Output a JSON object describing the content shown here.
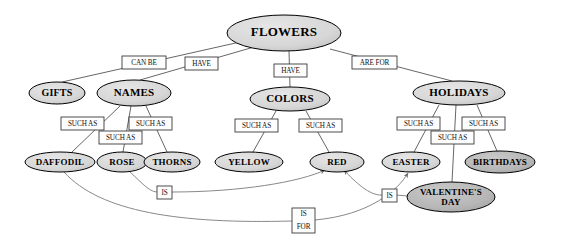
{
  "diagram": {
    "type": "concept-map",
    "colors": {
      "node_fill_light": "#d9d9d9",
      "node_fill_dark": "#b5b5b5",
      "node_stroke": "#000000",
      "edge_stroke": "#555555",
      "curve_stroke": "#7a7a7a",
      "label_box_fill": "#fdfdfd",
      "label_box_stroke": "#3a3a3a",
      "background": "#ffffff"
    },
    "nodes": [
      {
        "id": "flowers",
        "label": "FLOWERS",
        "cx": 284,
        "cy": 33,
        "rx": 57,
        "ry": 18,
        "font": 13,
        "fill": "#d9d9d9",
        "lines": [
          "FLOWERS"
        ]
      },
      {
        "id": "gifts",
        "label": "GIFTS",
        "cx": 57,
        "cy": 93,
        "rx": 28,
        "ry": 11,
        "font": 10,
        "fill": "#d9d9d9",
        "lines": [
          "GIFTS"
        ]
      },
      {
        "id": "names",
        "label": "NAMES",
        "cx": 134,
        "cy": 93,
        "rx": 37,
        "ry": 13,
        "font": 11,
        "fill": "#d9d9d9",
        "lines": [
          "NAMES"
        ]
      },
      {
        "id": "colors",
        "label": "COLORS",
        "cx": 290,
        "cy": 99,
        "rx": 40,
        "ry": 12,
        "font": 11,
        "fill": "#d9d9d9",
        "lines": [
          "COLORS"
        ]
      },
      {
        "id": "holidays",
        "label": "HOLIDAYS",
        "cx": 459,
        "cy": 93,
        "rx": 46,
        "ry": 12,
        "font": 11,
        "fill": "#d9d9d9",
        "lines": [
          "HOLIDAYS"
        ]
      },
      {
        "id": "daffodil",
        "label": "DAFFODIL",
        "cx": 60,
        "cy": 162,
        "rx": 35,
        "ry": 10,
        "font": 9,
        "fill": "#d9d9d9",
        "lines": [
          "DAFFODIL"
        ]
      },
      {
        "id": "rose",
        "label": "ROSE",
        "cx": 122,
        "cy": 162,
        "rx": 25,
        "ry": 10,
        "font": 9,
        "fill": "#d9d9d9",
        "lines": [
          "ROSE"
        ]
      },
      {
        "id": "thorns",
        "label": "THORNS",
        "cx": 172,
        "cy": 162,
        "rx": 28,
        "ry": 10,
        "font": 9,
        "fill": "#d9d9d9",
        "lines": [
          "THORNS"
        ]
      },
      {
        "id": "yellow",
        "label": "YELLOW",
        "cx": 249,
        "cy": 162,
        "rx": 34,
        "ry": 10,
        "font": 9,
        "fill": "#d9d9d9",
        "lines": [
          "YELLOW"
        ]
      },
      {
        "id": "red",
        "label": "RED",
        "cx": 337,
        "cy": 162,
        "rx": 27,
        "ry": 10,
        "font": 9,
        "fill": "#d9d9d9",
        "lines": [
          "RED"
        ]
      },
      {
        "id": "easter",
        "label": "EASTER",
        "cx": 411,
        "cy": 162,
        "rx": 29,
        "ry": 10,
        "font": 9,
        "fill": "#d9d9d9",
        "lines": [
          "EASTER"
        ]
      },
      {
        "id": "birthdays",
        "label": "BIRTHDAYS",
        "cx": 500,
        "cy": 162,
        "rx": 35,
        "ry": 11,
        "font": 9,
        "fill": "#b5b5b5",
        "lines": [
          "BIRTHDAYS"
        ]
      },
      {
        "id": "valentines",
        "label": "VALENTINE'S DAY",
        "cx": 451,
        "cy": 197,
        "rx": 44,
        "ry": 15,
        "font": 9,
        "fill": "#b5b5b5",
        "lines": [
          "VALENTINE'S",
          "DAY"
        ]
      }
    ],
    "edges": [
      {
        "id": "flowers-gifts",
        "from": "flowers",
        "to": "gifts",
        "label": "CAN BE",
        "path": "M 240 42 L 62 82",
        "arrow": false
      },
      {
        "id": "flowers-names",
        "from": "flowers",
        "to": "names",
        "label": "HAVE",
        "path": "M 254 47 L 140 80",
        "arrow": false
      },
      {
        "id": "flowers-colors",
        "from": "flowers",
        "to": "colors",
        "label": "HAVE",
        "path": "M 289 51 L 290 87",
        "arrow": false
      },
      {
        "id": "flowers-holidays",
        "from": "flowers",
        "to": "holidays",
        "label": "ARE FOR",
        "path": "M 330 49 L 452 81",
        "arrow": false
      },
      {
        "id": "names-daffodil",
        "from": "names",
        "to": "daffodil",
        "label": "SUCH AS",
        "path": "M 120 106 L 72 152",
        "arrow": false
      },
      {
        "id": "names-rose",
        "from": "names",
        "to": "rose",
        "label": "SUCH AS",
        "path": "M 131 106 L 123 152",
        "arrow": false
      },
      {
        "id": "names-thorns",
        "from": "names",
        "to": "thorns",
        "label": "SUCH AS",
        "path": "M 146 106 L 167 152",
        "arrow": false
      },
      {
        "id": "colors-yellow",
        "from": "colors",
        "to": "yellow",
        "label": "SUCH AS",
        "path": "M 276 111 L 253 152",
        "arrow": false
      },
      {
        "id": "colors-red",
        "from": "colors",
        "to": "red",
        "label": "SUCH AS",
        "path": "M 306 111 L 329 152",
        "arrow": false
      },
      {
        "id": "holidays-easter",
        "from": "holidays",
        "to": "easter",
        "label": "SUCH AS",
        "path": "M 439 105 L 414 152",
        "arrow": false
      },
      {
        "id": "holidays-valentines",
        "from": "holidays",
        "to": "valentines",
        "label": "SUCH AS",
        "path": "M 456 105 L 452 182",
        "arrow": false
      },
      {
        "id": "holidays-birthdays",
        "from": "holidays",
        "to": "birthdays",
        "label": "SUCH AS",
        "path": "M 477 105 L 497 151",
        "arrow": false
      },
      {
        "id": "rose-is-red",
        "from": "rose",
        "to": "red",
        "label": "IS",
        "path": "M 129 171 C 145 186 150 192 158 192 M 172 192 C 240 192 300 182 325 170",
        "arrow": true
      },
      {
        "id": "valentines-is-red",
        "from": "valentines",
        "to": "red",
        "label": "IS",
        "path": "M 408 196 L 396 195 M 382 195 C 370 196 355 182 344 170",
        "arrow": true
      },
      {
        "id": "daffodil-isfor-easter",
        "from": "daffodil",
        "to": "easter",
        "label": "IS FOR",
        "path": "M 64 172 C 100 212 180 224 292 221 M 315 220 C 370 215 398 190 408 173",
        "arrow": true
      }
    ],
    "edge_labels": [
      {
        "id": "can-be",
        "text": "CAN BE",
        "lines": [
          "CAN BE"
        ],
        "x": 122,
        "y": 56,
        "w": 44,
        "h": 13
      },
      {
        "id": "have-names",
        "text": "HAVE",
        "lines": [
          "HAVE"
        ],
        "x": 185,
        "y": 57,
        "w": 33,
        "h": 13
      },
      {
        "id": "have-colors",
        "text": "HAVE",
        "lines": [
          "HAVE"
        ],
        "x": 274,
        "y": 64,
        "w": 33,
        "h": 13
      },
      {
        "id": "are-for",
        "text": "ARE FOR",
        "lines": [
          "ARE FOR"
        ],
        "x": 352,
        "y": 56,
        "w": 45,
        "h": 13
      },
      {
        "id": "such-as-1",
        "text": "SUCH AS",
        "lines": [
          "SUCH AS"
        ],
        "x": 61,
        "y": 117,
        "w": 43,
        "h": 13
      },
      {
        "id": "such-as-2",
        "text": "SUCH AS",
        "lines": [
          "SUCH AS"
        ],
        "x": 99,
        "y": 131,
        "w": 43,
        "h": 13
      },
      {
        "id": "such-as-3",
        "text": "SUCH AS",
        "lines": [
          "SUCH AS"
        ],
        "x": 129,
        "y": 117,
        "w": 43,
        "h": 13
      },
      {
        "id": "such-as-4",
        "text": "SUCH AS",
        "lines": [
          "SUCH AS"
        ],
        "x": 235,
        "y": 119,
        "w": 43,
        "h": 13
      },
      {
        "id": "such-as-5",
        "text": "SUCH AS",
        "lines": [
          "SUCH AS"
        ],
        "x": 299,
        "y": 119,
        "w": 43,
        "h": 13
      },
      {
        "id": "such-as-6",
        "text": "SUCH AS",
        "lines": [
          "SUCH AS"
        ],
        "x": 397,
        "y": 117,
        "w": 43,
        "h": 13
      },
      {
        "id": "such-as-7",
        "text": "SUCH AS",
        "lines": [
          "SUCH AS"
        ],
        "x": 431,
        "y": 131,
        "w": 43,
        "h": 13
      },
      {
        "id": "such-as-8",
        "text": "SUCH AS",
        "lines": [
          "SUCH AS"
        ],
        "x": 462,
        "y": 117,
        "w": 43,
        "h": 13
      },
      {
        "id": "is-rose",
        "text": "IS",
        "lines": [
          "IS"
        ],
        "x": 157,
        "y": 186,
        "w": 15,
        "h": 13
      },
      {
        "id": "is-valent",
        "text": "IS",
        "lines": [
          "IS"
        ],
        "x": 382,
        "y": 189,
        "w": 15,
        "h": 13
      },
      {
        "id": "is-for",
        "text": "IS FOR",
        "lines": [
          "IS",
          "FOR"
        ],
        "x": 292,
        "y": 208,
        "w": 23,
        "h": 25
      }
    ]
  }
}
